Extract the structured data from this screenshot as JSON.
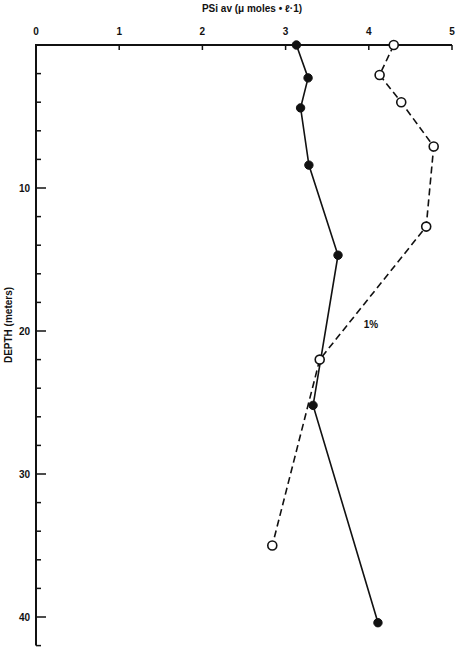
{
  "chart_data": {
    "type": "line",
    "title": "",
    "xlabel": "PSi av (μ moles • ℓ·1)",
    "ylabel": "DEPTH (meters)",
    "x_axis_position": "top",
    "y_axis_inverted": true,
    "xlim": [
      0,
      5
    ],
    "ylim": [
      0,
      42
    ],
    "x_ticks": [
      0,
      1,
      2,
      3,
      4,
      5
    ],
    "x_tick_labels": [
      "0",
      "1",
      "2",
      "3",
      "4",
      "5"
    ],
    "y_ticks": [
      0,
      10,
      20,
      30,
      40
    ],
    "y_tick_labels": [
      "",
      "10",
      "20",
      "30",
      "40"
    ],
    "y_minor_tick_step": 2,
    "grid": false,
    "legend": null,
    "series": [
      {
        "name": "filled circles (solid line)",
        "marker": "filled-circle",
        "line_style": "solid",
        "points": [
          {
            "x": 3.13,
            "y": 0
          },
          {
            "x": 3.27,
            "y": 2.3
          },
          {
            "x": 3.18,
            "y": 4.4
          },
          {
            "x": 3.28,
            "y": 8.4
          },
          {
            "x": 3.63,
            "y": 14.7
          },
          {
            "x": 3.33,
            "y": 25.2
          },
          {
            "x": 4.11,
            "y": 40.4
          }
        ]
      },
      {
        "name": "open circles (dashed line)",
        "marker": "open-circle",
        "line_style": "dashed",
        "points": [
          {
            "x": 4.3,
            "y": 0
          },
          {
            "x": 4.13,
            "y": 2.1
          },
          {
            "x": 4.39,
            "y": 4.0
          },
          {
            "x": 4.78,
            "y": 7.1
          },
          {
            "x": 4.69,
            "y": 12.7
          },
          {
            "x": 3.41,
            "y": 22.0
          },
          {
            "x": 2.84,
            "y": 35.0
          }
        ]
      }
    ],
    "annotations": [
      {
        "text": "1%",
        "x": 3.94,
        "y": 19.8
      }
    ]
  },
  "layout": {
    "origin_px": [
      36,
      45
    ],
    "px_per_x_unit": 83.2,
    "px_per_y_unit": 14.3
  }
}
